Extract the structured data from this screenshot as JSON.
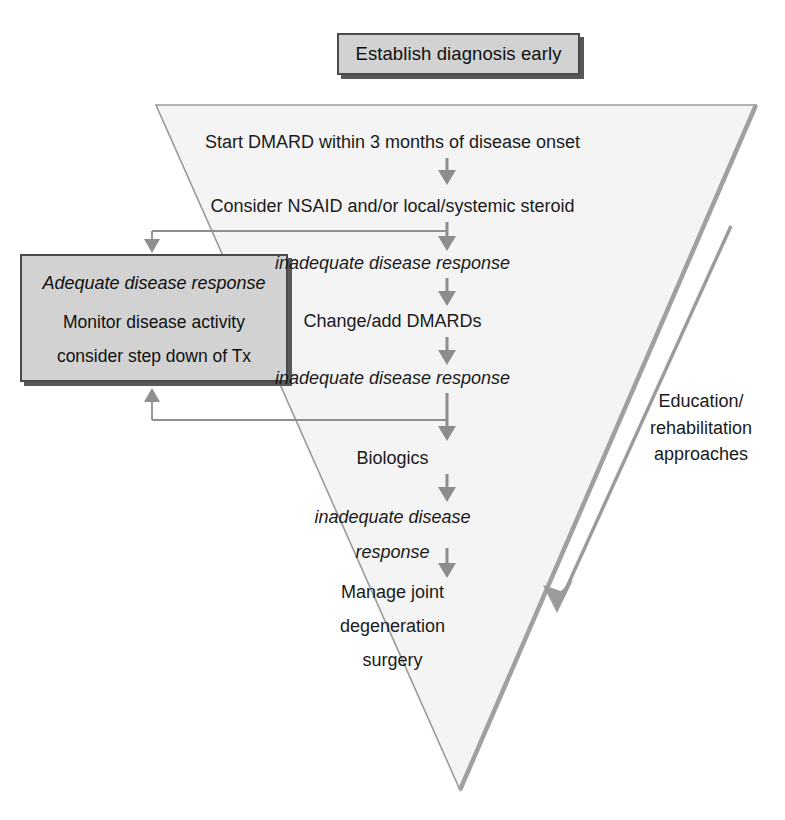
{
  "diagram": {
    "title_box": {
      "label": "Establish diagnosis early"
    },
    "side_note": {
      "line1": "Education/",
      "line2": "rehabilitation",
      "line3": "approaches"
    },
    "adequate_box": {
      "heading": "Adequate disease response",
      "line1": "Monitor disease activity",
      "line2": "consider step down of Tx"
    },
    "flow": {
      "step1": "Start DMARD within 3 months of disease onset",
      "step2": "Consider NSAID and/or local/systemic steroid",
      "step3": "inadequate disease response",
      "step4": "Change/add DMARDs",
      "step5": "inadequate disease response",
      "step6": "Biologics",
      "step7_line1": "inadequate disease",
      "step7_line2": "response",
      "step8_line1": "Manage joint",
      "step8_line2": "degeneration",
      "step8_line3": "surgery"
    },
    "colors": {
      "box_fill": "#d2d2d2",
      "box_border": "#4a4a4a",
      "box_shadow": "#585858",
      "triangle_fill": "#f4f4f4",
      "triangle_stroke": "#9a9a9a",
      "arrow_gray": "#8d8d8d",
      "connector_gray": "#8f8f8f",
      "text": "#1a1a1a"
    }
  }
}
